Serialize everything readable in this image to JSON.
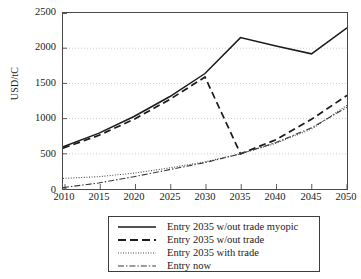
{
  "chart_data": {
    "type": "line",
    "title": "",
    "xlabel": "",
    "ylabel": "USD/tC",
    "xlim": [
      2010,
      2050
    ],
    "ylim": [
      0,
      2500
    ],
    "grid": true,
    "grid_axis": "y",
    "legend_position": "bottom",
    "x": [
      2010,
      2015,
      2020,
      2025,
      2030,
      2035,
      2040,
      2045,
      2050
    ],
    "xtick_labels": [
      "2010",
      "2015",
      "2020",
      "2025",
      "2030",
      "2035",
      "2040",
      "2045",
      "2050"
    ],
    "ytick_labels": [
      "0",
      "500",
      "1000",
      "1500",
      "2000",
      "2500"
    ],
    "ytick_values": [
      0,
      500,
      1000,
      1500,
      2000,
      2500
    ],
    "series": [
      {
        "name": "Entry 2035 w/out trade myopic",
        "style": "solid",
        "color": "#1a1a1a",
        "x": [
          2010,
          2015,
          2020,
          2025,
          2030,
          2035,
          2040,
          2045,
          2050
        ],
        "values": [
          600,
          790,
          1030,
          1310,
          1640,
          2150,
          2030,
          1920,
          2290
        ]
      },
      {
        "name": "Entry 2035 w/out trade",
        "style": "dashed",
        "color": "#1a1a1a",
        "x": [
          2010,
          2015,
          2020,
          2025,
          2030,
          2035,
          2040,
          2045,
          2050
        ],
        "values": [
          580,
          760,
          990,
          1270,
          1590,
          500,
          700,
          990,
          1330
        ]
      },
      {
        "name": "Entry 2035 with trade",
        "style": "dotted",
        "color": "#4a4a4a",
        "x": [
          2010,
          2015,
          2020,
          2025,
          2030,
          2035,
          2040,
          2045,
          2050
        ],
        "values": [
          150,
          175,
          225,
          300,
          385,
          500,
          650,
          850,
          1190
        ]
      },
      {
        "name": "Entry now",
        "style": "dashdot",
        "color": "#3a3a3a",
        "x": [
          2010,
          2015,
          2020,
          2025,
          2030,
          2035,
          2040,
          2045,
          2050
        ],
        "values": [
          20,
          85,
          175,
          275,
          375,
          500,
          660,
          870,
          1160
        ]
      }
    ]
  },
  "axis": {
    "y_label": "USD/tC",
    "y_ticks": [
      "2500",
      "2000",
      "1500",
      "1000",
      "500",
      "0"
    ],
    "x_ticks": [
      "2010",
      "2015",
      "2020",
      "2025",
      "2030",
      "2035",
      "2040",
      "2045",
      "2050"
    ]
  },
  "legend": {
    "items": [
      {
        "label": "Entry 2035 w/out trade myopic",
        "style": "solid"
      },
      {
        "label": "Entry 2035 w/out trade",
        "style": "dashed"
      },
      {
        "label": "Entry 2035 with trade",
        "style": "dotted"
      },
      {
        "label": "Entry now",
        "style": "dashdot"
      }
    ]
  }
}
